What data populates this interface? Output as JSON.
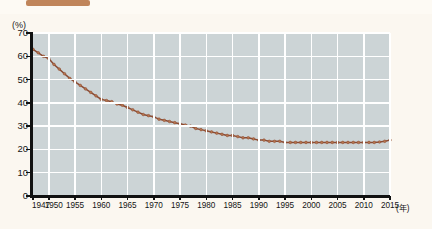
{
  "header": {
    "badge_label": "",
    "title_text": ""
  },
  "chart_data": {
    "type": "line",
    "title": "",
    "xlabel": "",
    "ylabel": "(%)",
    "x_unit_label": "(年)",
    "y_unit_label": "(%)",
    "ylim": [
      0,
      70
    ],
    "xlim": [
      1947,
      2015
    ],
    "grid": true,
    "legend": "none",
    "line_color": "#8a4a33",
    "marker_color": "#b6764f",
    "plot_background": "#ccd4d6",
    "gridline_color": "#ffffff",
    "y_ticks": [
      70,
      60,
      50,
      40,
      30,
      20,
      10,
      0
    ],
    "y_tick_labels": [
      "70",
      "60",
      "50",
      "40",
      "30",
      "20",
      "10",
      "0"
    ],
    "x_ticks": [
      1947,
      1950,
      1955,
      1960,
      1965,
      1970,
      1975,
      1980,
      1985,
      1990,
      1995,
      2000,
      2005,
      2010,
      2015
    ],
    "x_tick_labels": [
      "1947",
      "1950",
      "1955",
      "1960",
      "1965",
      "1970",
      "1975",
      "1980",
      "1985",
      "1990",
      "1995",
      "2000",
      "2005",
      "2010",
      "2015"
    ],
    "x": [
      1947,
      1948,
      1949,
      1950,
      1951,
      1952,
      1953,
      1954,
      1955,
      1956,
      1957,
      1958,
      1959,
      1960,
      1961,
      1962,
      1963,
      1964,
      1965,
      1966,
      1967,
      1968,
      1969,
      1970,
      1971,
      1972,
      1973,
      1974,
      1975,
      1976,
      1977,
      1978,
      1979,
      1980,
      1981,
      1982,
      1983,
      1984,
      1985,
      1986,
      1987,
      1988,
      1989,
      1990,
      1991,
      1992,
      1993,
      1994,
      1995,
      1996,
      1997,
      1998,
      1999,
      2000,
      2001,
      2002,
      2003,
      2004,
      2005,
      2006,
      2007,
      2008,
      2009,
      2010,
      2011,
      2012,
      2013,
      2014,
      2015
    ],
    "values": [
      63.0,
      61.5,
      60.0,
      59.0,
      56.5,
      54.5,
      52.5,
      50.5,
      49.0,
      47.5,
      46.0,
      44.5,
      43.0,
      41.5,
      41.0,
      40.5,
      39.5,
      39.0,
      38.0,
      37.0,
      36.0,
      35.0,
      34.5,
      34.0,
      33.0,
      32.5,
      32.0,
      31.5,
      31.0,
      30.5,
      30.0,
      29.0,
      28.5,
      28.0,
      27.5,
      27.0,
      26.5,
      26.0,
      26.0,
      25.5,
      25.0,
      25.0,
      24.5,
      24.0,
      24.0,
      23.5,
      23.5,
      23.5,
      23.0,
      23.0,
      23.0,
      23.0,
      23.0,
      23.0,
      23.0,
      23.0,
      23.0,
      23.0,
      23.0,
      23.0,
      23.0,
      23.0,
      23.0,
      23.0,
      23.0,
      23.0,
      23.2,
      23.5,
      24.0
    ]
  }
}
